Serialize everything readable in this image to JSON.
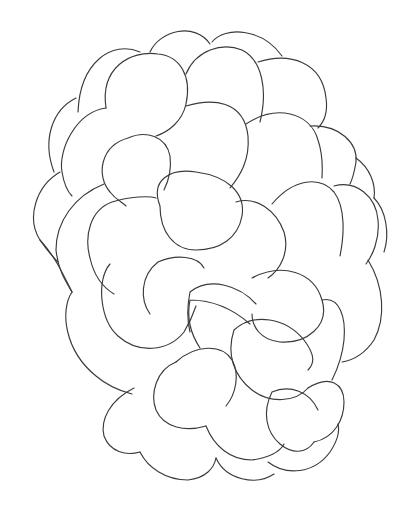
{
  "figure": {
    "background": "#ffffff",
    "stroke_color": "#3a3a3a",
    "width": 420,
    "height": 513
  },
  "drupelets": [
    {
      "id": "top-center",
      "d": "M150 52 C160 30 195 22 210 44"
    },
    {
      "id": "top-right",
      "d": "M212 42 C225 26 262 28 282 56"
    },
    {
      "id": "upper-left-back",
      "d": "M78 112 C80 62 112 40 140 52"
    },
    {
      "id": "upper-left-front",
      "d": "M106 108 C100 68 130 50 158 54 C180 56 192 76 186 104 C182 122 168 132 156 136"
    },
    {
      "id": "upper-center",
      "d": "M186 74 C196 50 222 42 242 50 C262 60 268 90 260 122"
    },
    {
      "id": "upper-right",
      "d": "M258 62 C290 52 322 62 326 98 C328 112 324 122 318 128"
    },
    {
      "id": "left-edge-1",
      "d": "M76 98 C52 110 42 140 54 172"
    },
    {
      "id": "left-mid-1",
      "d": "M106 108 C76 112 58 150 62 172 C64 184 68 192 72 196"
    },
    {
      "id": "center-large",
      "d": "M186 106 C212 98 244 100 248 136 C250 160 240 176 230 188"
    },
    {
      "id": "right-upper-mid",
      "d": "M246 124 C276 104 310 112 318 140 C324 158 322 172 322 178"
    },
    {
      "id": "right-edge-1",
      "d": "M310 126 C340 124 358 144 356 162 C354 174 352 180 350 184"
    },
    {
      "id": "right-edge-2",
      "d": "M356 158 C370 168 376 184 374 198"
    },
    {
      "id": "center-left-oval",
      "d": "M128 138 C146 130 166 136 170 156 C172 172 168 182 164 190 M128 138 C100 146 96 176 110 192 C116 200 122 202 126 206"
    },
    {
      "id": "left-mid-2",
      "d": "M60 172 C36 186 26 218 40 240 C48 252 54 258 58 262"
    },
    {
      "id": "left-mid-3",
      "d": "M104 184 C74 196 56 222 56 250 C58 270 66 282 72 292"
    },
    {
      "id": "center-oval",
      "d": "M160 206 C150 180 170 168 196 172 C226 176 246 192 242 216 C238 238 220 250 196 250 C174 250 160 232 160 206"
    },
    {
      "id": "center-left-large",
      "d": "M112 202 C90 210 84 236 90 258 C94 276 104 288 114 294 M112 202 C130 196 150 196 156 198"
    },
    {
      "id": "right-mid-1",
      "d": "M272 204 C294 178 320 176 334 192 C346 208 344 236 340 256"
    },
    {
      "id": "right-mid-2",
      "d": "M334 186 C356 180 376 196 378 220 C380 240 372 256 366 264"
    },
    {
      "id": "right-edge-3",
      "d": "M374 198 C386 210 390 234 384 252"
    },
    {
      "id": "center-right",
      "d": "M236 202 C256 196 276 210 284 232 C290 252 280 270 268 278"
    },
    {
      "id": "left-low-1",
      "d": "M40 240 C56 258 62 272 72 292"
    },
    {
      "id": "left-low-2",
      "d": "M72 292 C60 310 64 350 96 376 C110 388 124 392 132 394"
    },
    {
      "id": "center-low-1",
      "d": "M110 264 C96 280 100 320 118 336 C138 354 168 352 184 332 C190 322 194 312 196 306"
    },
    {
      "id": "center-low-2",
      "d": "M158 262 C176 254 198 256 204 268 M158 262 C140 276 140 300 150 314"
    },
    {
      "id": "mid-row-1",
      "d": "M190 292 C210 276 240 286 256 304 M190 292 C186 312 188 324 190 332"
    },
    {
      "id": "mid-row-2",
      "d": "M252 278 C282 262 314 272 322 300 C330 326 306 344 280 342 C260 340 252 326 252 314"
    },
    {
      "id": "right-low-1",
      "d": "M322 300 C340 296 346 318 344 340 C342 360 336 372 332 380"
    },
    {
      "id": "right-low-2",
      "d": "M368 260 C384 286 386 318 374 340 C366 352 354 360 342 362"
    },
    {
      "id": "lower-center-oval",
      "d": "M190 300 C214 300 234 310 250 324 M190 300 C186 320 192 336 200 348"
    },
    {
      "id": "lower-mid-1",
      "d": "M234 330 C254 312 286 318 304 340 C316 356 314 364 308 370 M234 330 C226 354 234 376 252 390 C270 404 296 402 308 388"
    },
    {
      "id": "lower-mid-2",
      "d": "M176 362 C196 344 222 344 232 360 C240 374 236 394 226 406"
    },
    {
      "id": "lower-left-1",
      "d": "M134 388 C110 400 100 420 104 436 C110 452 126 456 140 452"
    },
    {
      "id": "lower-left-2",
      "d": "M176 362 C156 370 150 394 156 410 C164 428 186 432 206 426"
    },
    {
      "id": "lower-right-1",
      "d": "M308 388 C330 374 344 384 344 402 C344 420 334 438 314 442"
    },
    {
      "id": "lower-right-2",
      "d": "M272 392 C290 384 310 392 318 410 M272 392 C262 412 266 432 280 444 C292 454 306 454 314 442"
    },
    {
      "id": "bottom-1",
      "d": "M140 452 C148 468 166 480 188 480 C206 478 214 468 216 458"
    },
    {
      "id": "bottom-2",
      "d": "M216 458 C226 480 256 486 274 474"
    },
    {
      "id": "bottom-3",
      "d": "M206 426 C214 446 230 460 252 460 C268 458 280 452 284 444"
    },
    {
      "id": "bottom-4",
      "d": "M268 462 C286 476 314 474 330 452 C338 440 340 432 338 424"
    }
  ]
}
